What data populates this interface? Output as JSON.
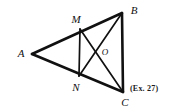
{
  "figure": {
    "kind": "geometry-diagram",
    "background_color": "#ffffff",
    "stroke_color": "#111111",
    "label_color": "#111111",
    "points": [
      {
        "id": "A",
        "label": "A",
        "x": 32,
        "y": 54,
        "label_x": 21,
        "label_y": 53,
        "size": "big"
      },
      {
        "id": "B",
        "label": "B",
        "x": 122,
        "y": 13,
        "label_x": 134,
        "label_y": 10,
        "size": "big"
      },
      {
        "id": "C",
        "label": "C",
        "x": 123,
        "y": 92,
        "label_x": 125,
        "label_y": 102,
        "size": "big"
      },
      {
        "id": "M",
        "label": "M",
        "x": 80,
        "y": 29,
        "label_x": 76,
        "label_y": 19,
        "size": "big"
      },
      {
        "id": "N",
        "label": "N",
        "x": 79,
        "y": 76,
        "label_x": 76,
        "label_y": 87,
        "size": "big"
      },
      {
        "id": "O",
        "label": "O",
        "x": 99,
        "y": 50,
        "label_x": 105,
        "label_y": 52,
        "size": "small"
      }
    ],
    "segments": [
      {
        "id": "AB",
        "from": "A",
        "to": "B",
        "width": 2.6
      },
      {
        "id": "AC",
        "from": "A",
        "to": "C",
        "width": 2.6
      },
      {
        "id": "BC",
        "from": "B",
        "to": "C",
        "width": 2.6
      },
      {
        "id": "MN",
        "from": "M",
        "to": "N",
        "width": 1.7
      },
      {
        "id": "MC",
        "from": "M",
        "to": "C",
        "width": 1.7
      },
      {
        "id": "NB",
        "from": "N",
        "to": "B",
        "width": 1.7
      }
    ],
    "caption": {
      "text": "(Ex. 27)",
      "x": 130,
      "y": 85
    }
  }
}
